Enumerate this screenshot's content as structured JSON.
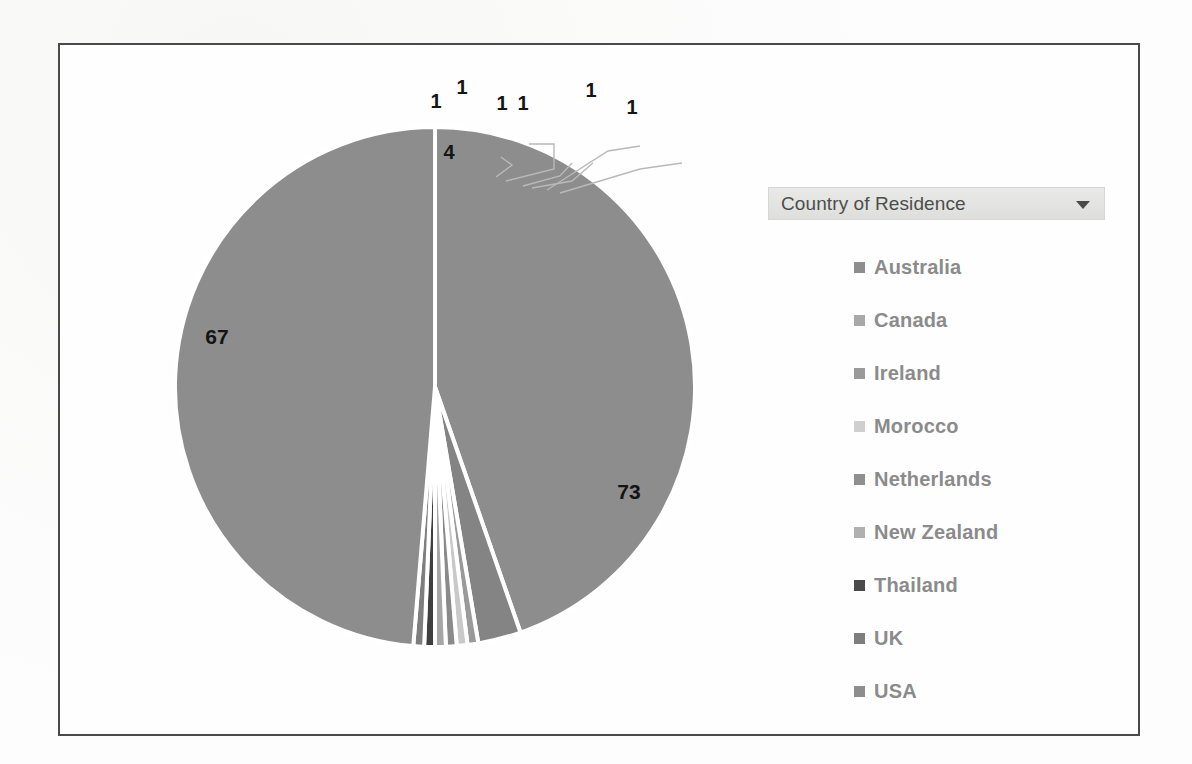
{
  "chart_data": {
    "type": "pie",
    "title": "",
    "legend_title": "Country of Residence",
    "legend_position": "right",
    "total": 149,
    "categories": [
      "Australia",
      "Canada",
      "Ireland",
      "Morocco",
      "Netherlands",
      "New Zealand",
      "Thailand",
      "UK",
      "USA"
    ],
    "values": [
      67,
      4,
      1,
      1,
      1,
      1,
      1,
      1,
      73
    ],
    "labels": [
      "67",
      "4",
      "1",
      "1",
      "1",
      "1",
      "1",
      "1",
      "73"
    ],
    "slice_colors": [
      "#8d8d8d",
      "#848484",
      "#9a9a9a",
      "#c9c9c9",
      "#8a8a8a",
      "#a6a6a6",
      "#3f3f3f",
      "#7e7e7e",
      "#8d8d8d"
    ],
    "legend_marker_colors": [
      "#8d8d8d",
      "#a8a8a8",
      "#9a9a9a",
      "#cfcfcf",
      "#8f8f8f",
      "#b0b0b0",
      "#4a4a4a",
      "#7e7e7e",
      "#8d8d8d"
    ],
    "label_color": "#141414",
    "separator_color": "#ffffff",
    "leader_line_color": "#b9b9b9",
    "border_color": "#4a4a4a",
    "background_color": "#fdfdfd"
  },
  "legend": {
    "filter_label": "Country of Residence",
    "filter_icon": "chevron-down-icon",
    "items": [
      {
        "label": "Australia",
        "color": "#8d8d8d"
      },
      {
        "label": "Canada",
        "color": "#a8a8a8"
      },
      {
        "label": "Ireland",
        "color": "#9a9a9a"
      },
      {
        "label": "Morocco",
        "color": "#cfcfcf"
      },
      {
        "label": "Netherlands",
        "color": "#8f8f8f"
      },
      {
        "label": "New Zealand",
        "color": "#b0b0b0"
      },
      {
        "label": "Thailand",
        "color": "#4a4a4a"
      },
      {
        "label": "UK",
        "color": "#7e7e7e"
      },
      {
        "label": "USA",
        "color": "#8d8d8d"
      }
    ]
  },
  "pie_labels": [
    {
      "text": "4",
      "x": 447,
      "y": 157
    },
    {
      "text": "67",
      "x": 215,
      "y": 342
    },
    {
      "text": "73",
      "x": 627,
      "y": 497
    },
    {
      "text": "1",
      "x": 434,
      "y": 106
    },
    {
      "text": "1",
      "x": 460,
      "y": 92
    },
    {
      "text": "1",
      "x": 500,
      "y": 108
    },
    {
      "text": "1",
      "x": 521,
      "y": 108
    },
    {
      "text": "1",
      "x": 589,
      "y": 95
    },
    {
      "text": "1",
      "x": 630,
      "y": 112
    }
  ]
}
